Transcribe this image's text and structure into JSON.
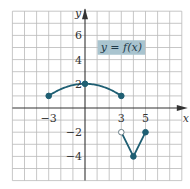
{
  "chart_data": {
    "type": "line",
    "title": "",
    "function_label": "y = f(x)",
    "xlabel": "x",
    "ylabel": "y",
    "xlim": [
      -6,
      8
    ],
    "ylim": [
      -6,
      8
    ],
    "grid": true,
    "x_tick_labels": [
      {
        "value": -3,
        "label": "−3"
      },
      {
        "value": 3,
        "label": "3"
      },
      {
        "value": 5,
        "label": "5"
      }
    ],
    "y_tick_labels": [
      {
        "value": 6,
        "label": "6"
      },
      {
        "value": 4,
        "label": "4"
      },
      {
        "value": 2,
        "label": "2"
      },
      {
        "value": -2,
        "label": "−2"
      },
      {
        "value": -4,
        "label": "−4"
      }
    ],
    "series": [
      {
        "name": "arc",
        "kind": "curve",
        "formula": "y = 2 - x^2/9",
        "x_range": [
          -3,
          3
        ],
        "points": [
          {
            "x": -3,
            "y": 1
          },
          {
            "x": 0,
            "y": 2
          },
          {
            "x": 3,
            "y": 1
          }
        ],
        "markers": [
          {
            "x": -3,
            "y": 1,
            "filled": true
          },
          {
            "x": 0,
            "y": 2,
            "filled": true
          },
          {
            "x": 3,
            "y": 1,
            "filled": true
          }
        ]
      },
      {
        "name": "v-shape",
        "kind": "polyline",
        "points": [
          {
            "x": 3,
            "y": -2
          },
          {
            "x": 4,
            "y": -4
          },
          {
            "x": 5,
            "y": -2
          }
        ],
        "markers": [
          {
            "x": 3,
            "y": -2,
            "filled": false
          },
          {
            "x": 4,
            "y": -4,
            "filled": true
          },
          {
            "x": 5,
            "y": -2,
            "filled": true
          }
        ]
      }
    ],
    "colors": {
      "curve": "#1f5f73",
      "grid": "#b9b9b9",
      "axis": "#333333",
      "label_box": "#a9c4cf"
    }
  }
}
